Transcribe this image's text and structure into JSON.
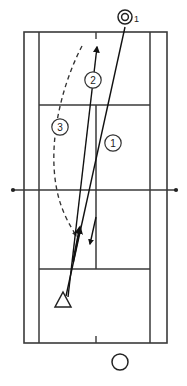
{
  "diagram": {
    "type": "tennis-court-play-diagram",
    "colors": {
      "court_line": "#3a3a3a",
      "shot_line": "#111111",
      "dashed_line": "#333333",
      "background": "#ffffff",
      "label_text": "#222222"
    },
    "court": {
      "outer_left_x": 24,
      "outer_right_x": 167,
      "outer_top_y": 32,
      "outer_bottom_y": 343,
      "singles_left_x": 39,
      "singles_right_x": 150,
      "far_service_line_y": 105,
      "near_service_line_y": 269,
      "center_service_line_x": 96,
      "net_y": 190,
      "net_left_x": 13,
      "net_right_x": 176,
      "center_mark_length": 7
    },
    "markers": [
      {
        "name": "opponent-position",
        "glyph": "double-circle",
        "label": "1",
        "label_position": "subscript-right",
        "x": 125,
        "y": 17,
        "radius": 7
      },
      {
        "name": "player-position",
        "glyph": "triangle",
        "label": "",
        "x": 63,
        "y": 301,
        "size": 11
      },
      {
        "name": "partner-position",
        "glyph": "circle",
        "label": "",
        "x": 120,
        "y": 362,
        "radius": 8
      }
    ],
    "shot_labels": [
      {
        "name": "shot-label-1",
        "label": "1",
        "x": 113,
        "y": 143,
        "radius": 9
      },
      {
        "name": "shot-label-2",
        "label": "2",
        "x": 93,
        "y": 80,
        "radius": 9
      },
      {
        "name": "shot-label-3",
        "label": "3",
        "x": 60,
        "y": 127,
        "radius": 9
      }
    ],
    "shots": [
      {
        "name": "shot-path-1",
        "style": "solid",
        "description": "incoming ball from opponent to player",
        "from": {
          "x": 125,
          "y": 27
        },
        "to": {
          "x": 66,
          "y": 295
        },
        "arrowheads": [
          {
            "x": 92,
            "y": 247,
            "direction": "down"
          }
        ]
      },
      {
        "name": "shot-path-2",
        "style": "solid",
        "description": "return shot from player hit deep crosscourt",
        "from": {
          "x": 68,
          "y": 297
        },
        "to": {
          "x": 97,
          "y": 44
        },
        "arrowheads": [
          {
            "x": 97,
            "y": 46,
            "direction": "up"
          },
          {
            "x": 79,
            "y": 222,
            "direction": "up"
          }
        ]
      },
      {
        "name": "shot-path-3",
        "style": "dashed",
        "description": "alternate looping ball trajectory",
        "from": {
          "x": 82,
          "y": 46
        },
        "control": {
          "x": 46,
          "y": 150
        },
        "to": {
          "x": 76,
          "y": 238
        },
        "arrowheads": [
          {
            "x": 76,
            "y": 236,
            "direction": "down"
          }
        ]
      }
    ]
  }
}
